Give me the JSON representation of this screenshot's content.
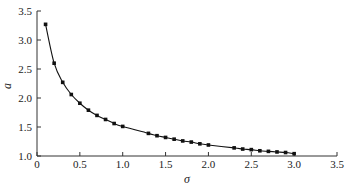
{
  "chart_data": {
    "type": "line",
    "title": "",
    "xlabel": "σ",
    "ylabel": "a",
    "xlim": [
      0,
      3.5
    ],
    "ylim": [
      1.0,
      3.5
    ],
    "xticks": [
      "0",
      "0.5",
      "1.0",
      "1.5",
      "2.0",
      "2.5",
      "3.0",
      "3.5"
    ],
    "yticks": [
      "1.0",
      "1.5",
      "2.0",
      "2.5",
      "3.0",
      "3.5"
    ],
    "grid": false,
    "legend": null,
    "series": [
      {
        "name": "a(σ)",
        "marker": "square",
        "color": "#111111",
        "x": [
          0.1,
          0.2,
          0.3,
          0.4,
          0.5,
          0.6,
          0.7,
          0.8,
          0.9,
          1.0,
          1.3,
          1.4,
          1.5,
          1.6,
          1.7,
          1.8,
          1.9,
          2.0,
          2.3,
          2.4,
          2.5,
          2.6,
          2.7,
          2.8,
          2.9,
          3.0
        ],
        "y": [
          3.27,
          2.6,
          2.27,
          2.06,
          1.91,
          1.79,
          1.7,
          1.63,
          1.56,
          1.51,
          1.39,
          1.35,
          1.32,
          1.29,
          1.26,
          1.24,
          1.21,
          1.19,
          1.14,
          1.12,
          1.11,
          1.09,
          1.08,
          1.07,
          1.06,
          1.04
        ]
      }
    ]
  }
}
